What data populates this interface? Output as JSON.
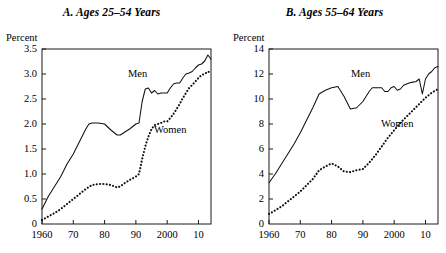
{
  "figure": {
    "axis_unit_label": "Percent",
    "series_names": {
      "men": "Men",
      "women": "Women"
    }
  },
  "panels": [
    {
      "id": "panel-a",
      "title": "A. Ages 25–54 Years",
      "unit_label": "Percent",
      "men_label": "Men",
      "women_label": "Women",
      "ytick_labels": [
        "3.5",
        "3.0",
        "2.5",
        "2.0",
        "1.5",
        "1.0",
        "0.5",
        "0"
      ],
      "xtick_labels": [
        "1960",
        "70",
        "80",
        "90",
        "2000",
        "10"
      ]
    },
    {
      "id": "panel-b",
      "title": "B. Ages 55–64 Years",
      "unit_label": "Percent",
      "men_label": "Men",
      "women_label": "Women",
      "ytick_labels": [
        "14",
        "12",
        "10",
        "8",
        "6",
        "4",
        "2",
        "0"
      ],
      "xtick_labels": [
        "1960",
        "70",
        "80",
        "90",
        "2000",
        "10"
      ]
    }
  ],
  "chart_data": [
    {
      "type": "line",
      "title": "A. Ages 25–54 Years",
      "xlabel": "",
      "ylabel": "Percent",
      "xlim": [
        1960,
        2014
      ],
      "ylim": [
        0,
        3.5
      ],
      "yticks": [
        0,
        0.5,
        1.0,
        1.5,
        2.0,
        2.5,
        3.0,
        3.5
      ],
      "ytick_labels": [
        "0",
        "0.5",
        "1.0",
        "1.5",
        "2.0",
        "2.5",
        "3.0",
        "3.5"
      ],
      "xticks": [
        1960,
        1970,
        1980,
        1990,
        2000,
        2010
      ],
      "xtick_labels": [
        "1960",
        "70",
        "80",
        "90",
        "2000",
        "10"
      ],
      "grid": false,
      "legend": "inline-annotation",
      "series": [
        {
          "name": "Men",
          "style": "solid",
          "x": [
            1960,
            1962,
            1964,
            1966,
            1968,
            1970,
            1972,
            1974,
            1975,
            1976,
            1978,
            1980,
            1982,
            1984,
            1985,
            1986,
            1988,
            1990,
            1991,
            1992,
            1993,
            1994,
            1995,
            1996,
            1997,
            1998,
            1999,
            2000,
            2001,
            2002,
            2003,
            2004,
            2005,
            2006,
            2007,
            2008,
            2009,
            2010,
            2011,
            2012,
            2013,
            2014
          ],
          "values": [
            0.3,
            0.55,
            0.75,
            0.95,
            1.2,
            1.4,
            1.65,
            1.9,
            2.0,
            2.02,
            2.02,
            2.0,
            1.88,
            1.78,
            1.78,
            1.82,
            1.9,
            2.0,
            2.02,
            2.45,
            2.7,
            2.72,
            2.62,
            2.67,
            2.6,
            2.62,
            2.62,
            2.62,
            2.72,
            2.8,
            2.82,
            2.82,
            2.92,
            3.0,
            3.02,
            3.05,
            3.12,
            3.18,
            3.2,
            3.26,
            3.38,
            3.3
          ]
        },
        {
          "name": "Women",
          "style": "dotted",
          "x": [
            1960,
            1962,
            1964,
            1966,
            1968,
            1970,
            1972,
            1974,
            1976,
            1978,
            1980,
            1982,
            1984,
            1985,
            1986,
            1988,
            1990,
            1991,
            1992,
            1993,
            1994,
            1995,
            1996,
            1997,
            1998,
            1999,
            2000,
            2001,
            2002,
            2003,
            2004,
            2005,
            2006,
            2007,
            2008,
            2009,
            2010,
            2011,
            2012,
            2013,
            2014
          ],
          "values": [
            0.08,
            0.15,
            0.22,
            0.3,
            0.4,
            0.5,
            0.6,
            0.7,
            0.78,
            0.8,
            0.8,
            0.78,
            0.73,
            0.75,
            0.8,
            0.88,
            0.95,
            1.0,
            1.3,
            1.55,
            1.75,
            1.9,
            1.98,
            2.0,
            2.02,
            2.05,
            2.05,
            2.12,
            2.2,
            2.3,
            2.4,
            2.52,
            2.62,
            2.72,
            2.78,
            2.85,
            2.92,
            2.98,
            3.0,
            3.05,
            3.02
          ]
        }
      ]
    },
    {
      "type": "line",
      "title": "B. Ages 55–64 Years",
      "xlabel": "",
      "ylabel": "Percent",
      "xlim": [
        1960,
        2014
      ],
      "ylim": [
        0,
        14
      ],
      "yticks": [
        0,
        2,
        4,
        6,
        8,
        10,
        12,
        14
      ],
      "ytick_labels": [
        "0",
        "2",
        "4",
        "6",
        "8",
        "10",
        "12",
        "14"
      ],
      "xticks": [
        1960,
        1970,
        1980,
        1990,
        2000,
        2010
      ],
      "xtick_labels": [
        "1960",
        "70",
        "80",
        "90",
        "2000",
        "10"
      ],
      "grid": false,
      "legend": "inline-annotation",
      "series": [
        {
          "name": "Men",
          "style": "solid",
          "x": [
            1960,
            1962,
            1964,
            1966,
            1968,
            1970,
            1972,
            1974,
            1976,
            1978,
            1980,
            1982,
            1984,
            1986,
            1988,
            1990,
            1991,
            1992,
            1993,
            1994,
            1995,
            1996,
            1997,
            1998,
            1999,
            2000,
            2001,
            2002,
            2003,
            2004,
            2005,
            2006,
            2007,
            2008,
            2009,
            2010,
            2011,
            2012,
            2013,
            2014
          ],
          "values": [
            3.3,
            4.0,
            4.8,
            5.6,
            6.4,
            7.3,
            8.3,
            9.3,
            10.4,
            10.7,
            10.9,
            11.0,
            10.2,
            9.2,
            9.3,
            9.8,
            10.2,
            10.6,
            10.9,
            10.9,
            10.9,
            10.9,
            10.6,
            10.6,
            10.9,
            11.0,
            10.7,
            10.8,
            11.1,
            11.2,
            11.3,
            11.35,
            11.4,
            11.6,
            10.4,
            11.6,
            12.0,
            12.2,
            12.5,
            12.6
          ]
        },
        {
          "name": "Women",
          "style": "dotted",
          "x": [
            1960,
            1962,
            1964,
            1966,
            1968,
            1970,
            1972,
            1974,
            1976,
            1978,
            1980,
            1982,
            1984,
            1986,
            1988,
            1990,
            1992,
            1994,
            1996,
            1998,
            2000,
            2002,
            2004,
            2006,
            2008,
            2010,
            2012,
            2014
          ],
          "values": [
            0.8,
            1.1,
            1.4,
            1.8,
            2.2,
            2.6,
            3.1,
            3.6,
            4.3,
            4.6,
            4.85,
            4.6,
            4.2,
            4.15,
            4.3,
            4.4,
            4.9,
            5.5,
            6.2,
            6.9,
            7.5,
            8.1,
            8.6,
            9.1,
            9.6,
            10.1,
            10.5,
            10.8
          ]
        }
      ]
    }
  ]
}
